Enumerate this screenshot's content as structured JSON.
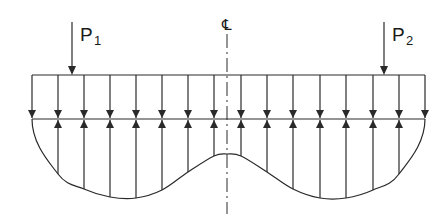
{
  "diagram": {
    "type": "structural-load-diagram",
    "colors": {
      "line": "#2a2a2a",
      "background": "#ffffff"
    },
    "loads": [
      {
        "label": "P",
        "subscript": "1",
        "x": 72
      },
      {
        "label": "P",
        "subscript": "2",
        "x": 384
      }
    ],
    "centerline": {
      "symbol": "℄",
      "x": 227
    },
    "beam": {
      "x_left": 32,
      "x_right": 425,
      "y_top": 75,
      "y_base": 119
    },
    "verticals_x": [
      32,
      58,
      84,
      110,
      136,
      162,
      188,
      214,
      241,
      267,
      293,
      320,
      346,
      373,
      399,
      425
    ],
    "pressure_curve": [
      [
        32,
        119
      ],
      [
        58,
        174
      ],
      [
        84,
        189
      ],
      [
        110,
        197
      ],
      [
        136,
        198
      ],
      [
        162,
        190
      ],
      [
        188,
        172
      ],
      [
        214,
        156
      ],
      [
        227,
        154
      ],
      [
        241,
        156
      ],
      [
        267,
        172
      ],
      [
        293,
        189
      ],
      [
        320,
        198
      ],
      [
        346,
        198
      ],
      [
        373,
        190
      ],
      [
        399,
        174
      ],
      [
        425,
        119
      ]
    ]
  }
}
